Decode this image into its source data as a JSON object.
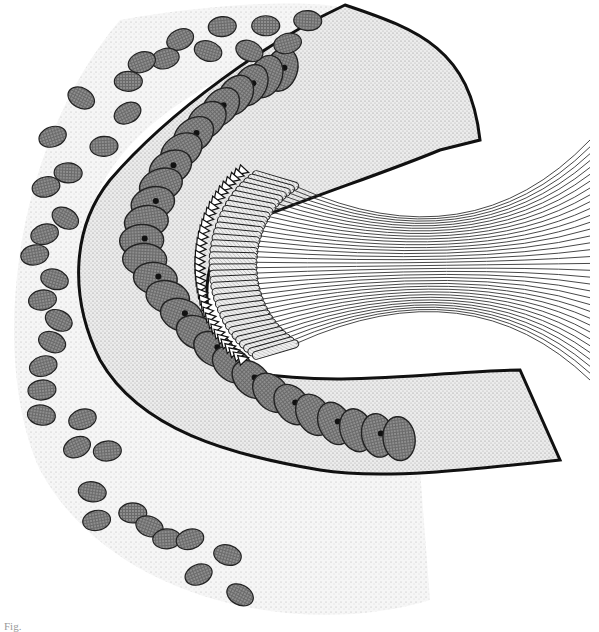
{
  "figure": {
    "colors": {
      "background": "#ffffff",
      "connective_tissue": "#d8d8d8",
      "cell_cytoplasm": "#e4e4e4",
      "nucleus": "#5a5a5a",
      "nucleolus": "#111111",
      "outline": "#1a1a1a",
      "membrane": "#111111"
    },
    "epithelium_cell_count": 28,
    "flagella_count": 36,
    "connective_nuclei_count": 40
  },
  "caption": {
    "text": "Fig."
  }
}
